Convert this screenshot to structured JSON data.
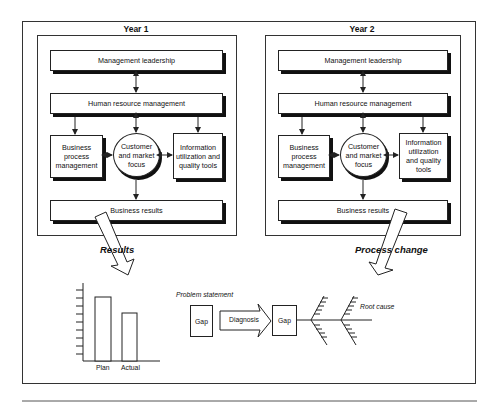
{
  "panels": [
    {
      "title": "Year 1",
      "boxes": {
        "top": "Management leadership",
        "middle": "Human resource management",
        "left": "Business process management",
        "center": "Customer and market focus",
        "right": "Information utilization and quality tools",
        "bottom": "Business results"
      }
    },
    {
      "title": "Year 2",
      "boxes": {
        "top": "Management leadership",
        "middle": "Human resource management",
        "left": "Business process management",
        "center": "Customer and market focus",
        "right": "Information utilization and quality tools",
        "bottom": "Business results"
      }
    }
  ],
  "arrows": {
    "left_label": "Results",
    "right_label": "Process change"
  },
  "bar_chart": {
    "categories": [
      "Plan",
      "Actual"
    ],
    "values": [
      8,
      6
    ],
    "tick_count": 10
  },
  "analysis": {
    "problem_statement": "Problem statement",
    "gap_1": "Gap",
    "diagnosis": "Diagnosis",
    "gap_2": "Gap",
    "root_cause": "Root cause"
  },
  "colors": {
    "line": "#222222",
    "shadow": "#111111",
    "background": "#ffffff"
  }
}
